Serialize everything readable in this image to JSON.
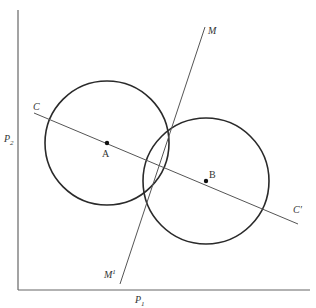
{
  "diagram": {
    "axes": {
      "x_label": "P",
      "x_label_sub": "1",
      "y_label": "P",
      "y_label_sub": "2"
    },
    "points": [
      {
        "id": "A",
        "label": "A"
      },
      {
        "id": "B",
        "label": "B"
      }
    ],
    "circles": [
      {
        "center": "A"
      },
      {
        "center": "B"
      }
    ],
    "lines": [
      {
        "id": "CC",
        "start_label": "C",
        "end_label": "C′"
      },
      {
        "id": "MM",
        "start_label": "M",
        "end_label": "M",
        "end_label_sup": "1"
      }
    ],
    "colors": {
      "stroke": "#2a2a2a",
      "axis": "#555555",
      "text": "#333333"
    }
  }
}
